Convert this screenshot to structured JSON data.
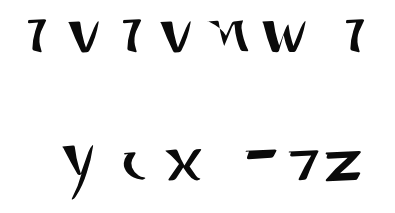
{
  "document": {
    "type": "calligraphy-specimen",
    "title": "Handwritten calligraphic script specimen",
    "background_color": "#ffffff",
    "ink_color": "#0a0a0a",
    "width": 395,
    "height": 213,
    "line_count": 2,
    "glyph_count": 13
  },
  "lines": [
    {
      "id": "line-1",
      "baseline_y": 51,
      "x_height_top_y": 22,
      "glyph_count": 7,
      "transcription": "ו v ו v n w ו",
      "glyphs": [
        {
          "index": 0,
          "name": "vertical-stroke",
          "label": "ו",
          "x": 27,
          "y": 19,
          "width": 22,
          "height": 33
        },
        {
          "index": 1,
          "name": "vee-stroke",
          "label": "v",
          "x": 68,
          "y": 21,
          "width": 30,
          "height": 31
        },
        {
          "index": 2,
          "name": "vertical-stroke",
          "label": "ו",
          "x": 122,
          "y": 19,
          "width": 22,
          "height": 33
        },
        {
          "index": 3,
          "name": "vee-stroke",
          "label": "v",
          "x": 160,
          "y": 21,
          "width": 30,
          "height": 31
        },
        {
          "index": 4,
          "name": "en-stroke",
          "label": "n",
          "x": 207,
          "y": 20,
          "width": 42,
          "height": 32
        },
        {
          "index": 5,
          "name": "double-vee-stroke",
          "label": "w",
          "x": 262,
          "y": 20,
          "width": 52,
          "height": 32
        },
        {
          "index": 6,
          "name": "vertical-stroke",
          "label": "ו",
          "x": 345,
          "y": 19,
          "width": 22,
          "height": 33
        }
      ]
    },
    {
      "id": "line-2",
      "baseline_y": 179,
      "x_height_top_y": 146,
      "descender_y": 200,
      "glyph_count": 6,
      "transcription": "y ו x ¯ 7 z",
      "glyphs": [
        {
          "index": 0,
          "name": "why-stroke",
          "label": "y",
          "x": 62,
          "y": 145,
          "width": 34,
          "height": 55
        },
        {
          "index": 1,
          "name": "diagonal-stroke",
          "label": "ו",
          "x": 124,
          "y": 152,
          "width": 28,
          "height": 27
        },
        {
          "index": 2,
          "name": "ex-stroke",
          "label": "x",
          "x": 165,
          "y": 149,
          "width": 36,
          "height": 31
        },
        {
          "index": 3,
          "name": "macron-stroke",
          "label": "¯",
          "x": 245,
          "y": 149,
          "width": 32,
          "height": 10
        },
        {
          "index": 4,
          "name": "seven-stroke",
          "label": "7",
          "x": 288,
          "y": 150,
          "width": 30,
          "height": 30
        },
        {
          "index": 5,
          "name": "zed-stroke",
          "label": "z",
          "x": 325,
          "y": 151,
          "width": 37,
          "height": 29
        }
      ]
    }
  ]
}
